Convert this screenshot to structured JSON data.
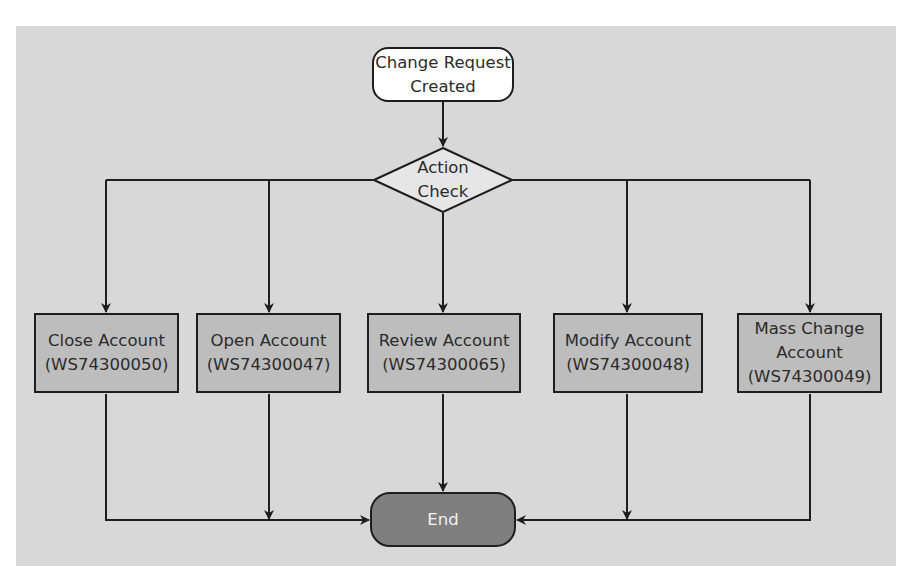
{
  "diagram": {
    "type": "flowchart",
    "colors": {
      "panel_background": "#d8d8d8",
      "page_background": "#ffffff",
      "start_fill": "#ffffff",
      "decision_fill": "#e6e6e6",
      "process_fill": "#bdbdbd",
      "end_fill": "#7f7f7f",
      "stroke": "#1e1e1e"
    },
    "start": {
      "line1": "Change Request",
      "line2": "Created"
    },
    "decision": {
      "line1": "Action",
      "line2": "Check"
    },
    "branches": [
      {
        "id": "close",
        "line1": "Close Account",
        "line2": "(WS74300050)"
      },
      {
        "id": "open",
        "line1": "Open Account",
        "line2": "(WS74300047)"
      },
      {
        "id": "review",
        "line1": "Review Account",
        "line2": "(WS74300065)"
      },
      {
        "id": "modify",
        "line1": "Modify Account",
        "line2": "(WS74300048)"
      },
      {
        "id": "mass",
        "line1": "Mass Change",
        "line2": "Account",
        "line3": "(WS74300049)"
      }
    ],
    "end": {
      "label": "End"
    },
    "edges": [
      {
        "from": "start",
        "to": "decision"
      },
      {
        "from": "decision",
        "to": "close"
      },
      {
        "from": "decision",
        "to": "open"
      },
      {
        "from": "decision",
        "to": "review"
      },
      {
        "from": "decision",
        "to": "modify"
      },
      {
        "from": "decision",
        "to": "mass"
      },
      {
        "from": "close",
        "to": "end"
      },
      {
        "from": "open",
        "to": "end"
      },
      {
        "from": "review",
        "to": "end"
      },
      {
        "from": "modify",
        "to": "end"
      },
      {
        "from": "mass",
        "to": "end"
      }
    ]
  }
}
